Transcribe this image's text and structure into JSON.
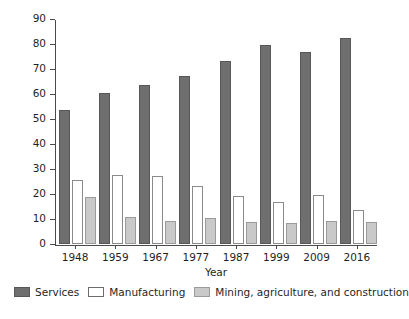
{
  "chart_data": {
    "type": "bar",
    "title": "",
    "xlabel": "Year",
    "ylabel": "Percentage of GDP",
    "categories": [
      "1948",
      "1959",
      "1967",
      "1977",
      "1987",
      "1999",
      "2009",
      "2016"
    ],
    "ylim": [
      0,
      90
    ],
    "yticks": [
      0,
      10,
      20,
      30,
      40,
      50,
      60,
      70,
      80,
      90
    ],
    "grid": false,
    "legend_position": "bottom",
    "series": [
      {
        "name": "Services",
        "color": "#6f6f6f",
        "values": [
          53.5,
          60.3,
          63.8,
          67.2,
          73.2,
          79.5,
          77.0,
          82.5
        ]
      },
      {
        "name": "Manufacturing",
        "color": "#ffffff",
        "values": [
          25.7,
          27.6,
          27.2,
          23.4,
          19.3,
          16.9,
          19.8,
          13.6
        ]
      },
      {
        "name": "Mining, agriculture, and construction",
        "color": "#c9c9c9",
        "values": [
          18.7,
          10.8,
          9.3,
          10.5,
          8.9,
          8.5,
          9.4,
          8.7
        ]
      }
    ]
  }
}
